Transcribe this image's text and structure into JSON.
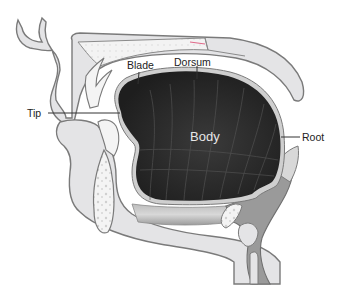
{
  "diagram": {
    "labels": {
      "blade": "Blade",
      "dorsum": "Dorsum",
      "tip": "Tip",
      "body": "Body",
      "root": "Root"
    },
    "colors": {
      "tissue_fill": "#e4e4e6",
      "outline": "#7a7a7a",
      "tongue_fill": "#2b2b2b",
      "bone_fill": "#f3f3f3",
      "muscle_fill": "#a9a9a9",
      "pharynx_fill": "#8e8e8e",
      "label_text": "#222222",
      "body_text": "#e6e6e6",
      "accent_pink": "#e06a8a"
    }
  }
}
